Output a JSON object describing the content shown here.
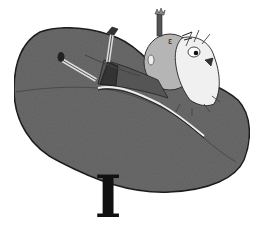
{
  "illustration": {
    "description": "Grayscale cartoon of a figure with wild hair lying back on a large bean bag",
    "letter_glyph": "I",
    "colors": {
      "background": "#ffffff",
      "beanbag": "#6a6a6a",
      "beanbag_outline": "#222222",
      "body": "#b0b0b0",
      "legs": "#555555",
      "ink": "#111111"
    }
  }
}
